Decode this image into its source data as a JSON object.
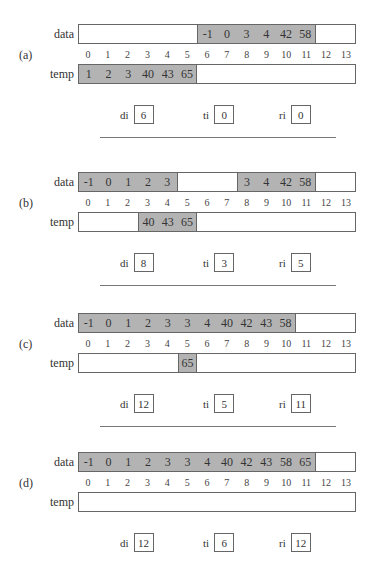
{
  "labels": {
    "data": "data",
    "temp": "temp",
    "di": "di",
    "ti": "ti",
    "ri": "ri"
  },
  "indices": [
    "0",
    "1",
    "2",
    "3",
    "4",
    "5",
    "6",
    "7",
    "8",
    "9",
    "10",
    "11",
    "12",
    "13"
  ],
  "colors": {
    "filled": "#b3b3b3",
    "border": "#666666",
    "background": "#ffffff"
  },
  "panels": [
    {
      "id": "a",
      "label": "(a)",
      "data": [
        "",
        "",
        "",
        "",
        "",
        "",
        "-1",
        "0",
        "3",
        "4",
        "42",
        "58",
        "",
        ""
      ],
      "data_filled": [
        [
          6,
          11
        ]
      ],
      "temp": [
        "1",
        "2",
        "3",
        "40",
        "43",
        "65",
        "",
        "",
        "",
        "",
        "",
        "",
        "",
        ""
      ],
      "temp_filled": [
        [
          0,
          5
        ]
      ],
      "di": "6",
      "ti": "0",
      "ri": "0"
    },
    {
      "id": "b",
      "label": "(b)",
      "data": [
        "-1",
        "0",
        "1",
        "2",
        "3",
        "",
        "",
        "",
        "3",
        "4",
        "42",
        "58",
        "",
        ""
      ],
      "data_filled": [
        [
          0,
          4
        ],
        [
          8,
          11
        ]
      ],
      "temp": [
        "",
        "",
        "",
        "40",
        "43",
        "65",
        "",
        "",
        "",
        "",
        "",
        "",
        "",
        ""
      ],
      "temp_filled": [
        [
          3,
          5
        ]
      ],
      "di": "8",
      "ti": "3",
      "ri": "5"
    },
    {
      "id": "c",
      "label": "(c)",
      "data": [
        "-1",
        "0",
        "1",
        "2",
        "3",
        "3",
        "4",
        "40",
        "42",
        "43",
        "58",
        "",
        "",
        ""
      ],
      "data_filled": [
        [
          0,
          10
        ]
      ],
      "temp": [
        "",
        "",
        "",
        "",
        "",
        "65",
        "",
        "",
        "",
        "",
        "",
        "",
        "",
        ""
      ],
      "temp_filled": [
        [
          5,
          5
        ]
      ],
      "di": "12",
      "ti": "5",
      "ri": "11"
    },
    {
      "id": "d",
      "label": "(d)",
      "data": [
        "-1",
        "0",
        "1",
        "2",
        "3",
        "3",
        "4",
        "40",
        "42",
        "43",
        "58",
        "65",
        "",
        ""
      ],
      "data_filled": [
        [
          0,
          11
        ]
      ],
      "temp": [
        "",
        "",
        "",
        "",
        "",
        "",
        "",
        "",
        "",
        "",
        "",
        "",
        "",
        ""
      ],
      "temp_filled": [],
      "di": "12",
      "ti": "6",
      "ri": "12"
    }
  ]
}
